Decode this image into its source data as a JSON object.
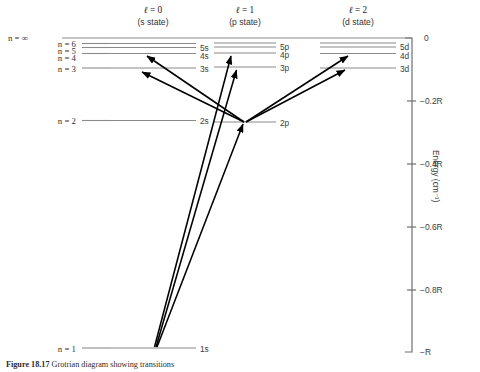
{
  "figure": {
    "caption_label": "Figure 18.17",
    "caption_text": "Grotrian diagram showing transitions",
    "axis_title": "Energy (cm⁻¹)"
  },
  "columns": [
    {
      "id": "s",
      "symbol": "ℓ = 0",
      "state": "(s state)",
      "x_left": 110,
      "x_right": 196,
      "label_x": 200
    },
    {
      "id": "p",
      "symbol": "ℓ = 1",
      "state": "(p state)",
      "x_left": 214,
      "x_right": 276,
      "label_x": 280
    },
    {
      "id": "d",
      "symbol": "ℓ = 2",
      "state": "(d state)",
      "x_left": 320,
      "x_right": 396,
      "label_x": 400
    }
  ],
  "continuum": {
    "label": "n = ∞",
    "y": 38,
    "x_start": 62,
    "x_end": 412
  },
  "n_labels": [
    {
      "text": "n = 6",
      "x": 72,
      "y": 45
    },
    {
      "text": "n = 5",
      "x": 72,
      "y": 52
    },
    {
      "text": "n = 4",
      "x": 72,
      "y": 59
    },
    {
      "text": "n = 3",
      "x": 72,
      "y": 70
    },
    {
      "text": "n = 2",
      "x": 72,
      "y": 121
    },
    {
      "text": "n = 1",
      "x": 72,
      "y": 349
    }
  ],
  "levels": {
    "s": [
      {
        "label": "6s",
        "y": 43.5,
        "energy": -0.028
      },
      {
        "label": "5s",
        "y": 47.5,
        "energy": -0.04
      },
      {
        "label": "4s",
        "y": 53.5,
        "energy": -0.062
      },
      {
        "label": "3s",
        "y": 68.0,
        "energy": -0.111
      },
      {
        "label": "2s",
        "y": 120.5,
        "energy": -0.25
      }
    ],
    "p": [
      {
        "label": "6p",
        "y": 43.0,
        "energy": -0.028
      },
      {
        "label": "5p",
        "y": 47.0,
        "energy": -0.04
      },
      {
        "label": "4p",
        "y": 53.0,
        "energy": -0.062
      },
      {
        "label": "3p",
        "y": 67.0,
        "energy": -0.111
      },
      {
        "label": "2p",
        "y": 122.0,
        "energy": -0.25
      }
    ],
    "d": [
      {
        "label": "6d",
        "y": 43.0,
        "energy": -0.028
      },
      {
        "label": "5d",
        "y": 47.0,
        "energy": -0.04
      },
      {
        "label": "4d",
        "y": 53.5,
        "energy": -0.062
      },
      {
        "label": "3d",
        "y": 68.0,
        "energy": -0.111
      }
    ],
    "ground": [
      {
        "label": "1s",
        "y": 348.0,
        "energy": -1.0
      }
    ]
  },
  "level_label_text": {
    "s6": "6s",
    "s5": "5s",
    "s4": "4s",
    "s3": "3s",
    "s2": "2s",
    "p6": "6p",
    "p5": "5p",
    "p4": "4p",
    "p3": "3p",
    "p2": "2p",
    "d6": "6d",
    "d5": "5d",
    "d4": "4d",
    "d3": "3d",
    "g1": "1s"
  },
  "axis": {
    "x": 412,
    "y_top": 38,
    "y_bottom": 352,
    "ticks": [
      {
        "label": "0",
        "y": 38
      },
      {
        "label": "−0.2R",
        "y": 101
      },
      {
        "label": "−0.4R",
        "y": 164
      },
      {
        "label": "−0.6R",
        "y": 227
      },
      {
        "label": "−0.8R",
        "y": 290
      },
      {
        "label": "−R",
        "y": 352
      }
    ]
  },
  "transitions": [
    {
      "name": "1s-2p",
      "from": [
        157,
        347
      ],
      "to": [
        243,
        124
      ]
    },
    {
      "name": "1s-3p",
      "from": [
        156,
        347
      ],
      "to": [
        236,
        70
      ]
    },
    {
      "name": "1s-4p",
      "from": [
        155,
        347
      ],
      "to": [
        231,
        56
      ]
    },
    {
      "name": "2p-3s",
      "from": [
        244,
        122
      ],
      "to": [
        142,
        72
      ]
    },
    {
      "name": "2p-4s",
      "from": [
        244,
        122
      ],
      "to": [
        147,
        56
      ]
    },
    {
      "name": "2p-3d",
      "from": [
        246,
        122
      ],
      "to": [
        345,
        70
      ]
    },
    {
      "name": "2p-4d",
      "from": [
        246,
        122
      ],
      "to": [
        348,
        56
      ]
    }
  ],
  "colors": {
    "level_line": "#8a8a8a",
    "transition_line": "#000000",
    "axis": "#6f6f6f",
    "text": "#333333",
    "background": "#ffffff"
  }
}
